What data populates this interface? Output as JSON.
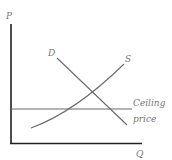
{
  "diagram": {
    "type": "supply-demand-price-ceiling",
    "axes": {
      "y_label": "P",
      "x_label": "Q"
    },
    "curves": [
      {
        "name": "demand",
        "label": "D"
      },
      {
        "name": "supply",
        "label": "S"
      }
    ],
    "ceiling": {
      "label_line1": "Ceiling",
      "label_line2": "price"
    },
    "colors": {
      "axis": "#222222",
      "curve": "#6a6a6a",
      "label": "#777777"
    }
  }
}
